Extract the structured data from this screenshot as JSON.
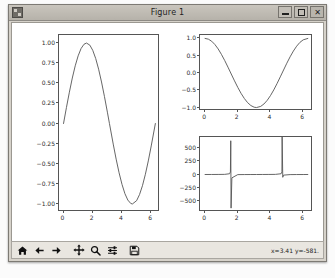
{
  "window": {
    "title": "Figure 1",
    "icon": "matplotlib-app-icon",
    "controls": {
      "minimize": "–",
      "maximize": "□",
      "close": "✕"
    }
  },
  "toolbar": {
    "buttons": [
      {
        "name": "home-icon",
        "tooltip": "Home"
      },
      {
        "name": "back-arrow-icon",
        "tooltip": "Back"
      },
      {
        "name": "forward-arrow-icon",
        "tooltip": "Forward"
      },
      {
        "name": "pan-move-icon",
        "tooltip": "Pan"
      },
      {
        "name": "zoom-magnifier-icon",
        "tooltip": "Zoom to rectangle"
      },
      {
        "name": "configure-subplots-icon",
        "tooltip": "Configure subplots"
      },
      {
        "name": "save-floppy-icon",
        "tooltip": "Save the figure"
      }
    ],
    "coordinates": "x=3.41  y=-581."
  },
  "caption": "",
  "chart_data": [
    {
      "type": "line",
      "name": "sine-subplot",
      "title": "",
      "xlabel": "",
      "ylabel": "",
      "x": [
        0,
        0.2,
        0.4,
        0.6,
        0.8,
        1.0,
        1.2,
        1.4,
        1.5708,
        1.8,
        2.0,
        2.2,
        2.4,
        2.6,
        2.8,
        3.0,
        3.1416,
        3.4,
        3.6,
        3.8,
        4.0,
        4.2,
        4.4,
        4.6,
        4.7124,
        5.0,
        5.2,
        5.4,
        5.6,
        5.8,
        6.0,
        6.2832
      ],
      "y": [
        0.0,
        0.199,
        0.389,
        0.565,
        0.717,
        0.841,
        0.932,
        0.985,
        1.0,
        0.974,
        0.909,
        0.808,
        0.675,
        0.516,
        0.335,
        0.141,
        0.0,
        -0.256,
        -0.443,
        -0.612,
        -0.757,
        -0.872,
        -0.952,
        -0.994,
        -1.0,
        -0.959,
        -0.883,
        -0.773,
        -0.631,
        -0.465,
        -0.279,
        0.0
      ],
      "xlim": [
        -0.31,
        6.6
      ],
      "ylim": [
        -1.1,
        1.1
      ],
      "xticks": [
        "0",
        "2",
        "4",
        "6"
      ],
      "xtick_values": [
        0,
        2,
        4,
        6
      ],
      "yticks": [
        "1.00",
        "0.75",
        "0.50",
        "0.25",
        "0.00",
        "−0.25",
        "−0.50",
        "−0.75",
        "−1.00"
      ],
      "ytick_values": [
        1.0,
        0.75,
        0.5,
        0.25,
        0.0,
        -0.25,
        -0.5,
        -0.75,
        -1.0
      ],
      "grid": false,
      "legend": null,
      "line_color": "#555555"
    },
    {
      "type": "line",
      "name": "cosine-subplot",
      "title": "",
      "xlabel": "",
      "ylabel": "",
      "x": [
        0,
        0.2,
        0.4,
        0.6,
        0.8,
        1.0,
        1.2,
        1.4,
        1.5708,
        1.8,
        2.0,
        2.2,
        2.4,
        2.6,
        2.8,
        3.0,
        3.1416,
        3.4,
        3.6,
        3.8,
        4.0,
        4.2,
        4.4,
        4.6,
        4.7124,
        5.0,
        5.2,
        5.4,
        5.6,
        5.8,
        6.0,
        6.2832
      ],
      "y": [
        1.0,
        0.98,
        0.921,
        0.825,
        0.697,
        0.54,
        0.362,
        0.17,
        0.0,
        -0.227,
        -0.416,
        -0.589,
        -0.737,
        -0.857,
        -0.942,
        -0.99,
        -1.0,
        -0.967,
        -0.897,
        -0.791,
        -0.654,
        -0.49,
        -0.307,
        -0.112,
        0.0,
        0.284,
        0.469,
        0.635,
        0.776,
        0.886,
        0.96,
        1.0
      ],
      "xlim": [
        -0.31,
        6.6
      ],
      "ylim": [
        -1.1,
        1.1
      ],
      "xticks": [
        "0",
        "2",
        "4",
        "6"
      ],
      "xtick_values": [
        0,
        2,
        4,
        6
      ],
      "yticks": [
        "1.0",
        "0.5",
        "0.0",
        "−0.5",
        "−1.0"
      ],
      "ytick_values": [
        1.0,
        0.5,
        0.0,
        -0.5,
        -1.0
      ],
      "grid": false,
      "legend": null,
      "line_color": "#555555"
    },
    {
      "type": "line",
      "name": "tangent-subplot",
      "title": "",
      "xlabel": "",
      "ylabel": "",
      "x": [
        0,
        0.4,
        0.8,
        1.2,
        1.5,
        1.55,
        1.5708,
        1.59,
        1.64,
        2.0,
        2.4,
        2.8,
        3.1416,
        3.5,
        3.9,
        4.3,
        4.65,
        4.7,
        4.7124,
        4.75,
        4.8,
        5.2,
        5.6,
        6.0,
        6.2832
      ],
      "y": [
        0,
        0.42,
        1.03,
        2.57,
        14.1,
        48.1,
        630,
        -628,
        -62.5,
        -2.19,
        -0.92,
        -0.36,
        0,
        0.37,
        0.95,
        2.29,
        14.2,
        48.5,
        700,
        -52.0,
        -11.4,
        -1.89,
        -0.81,
        -0.29,
        0
      ],
      "xlim": [
        -0.31,
        6.6
      ],
      "ylim": [
        -700,
        700
      ],
      "xticks": [
        "0",
        "2",
        "4",
        "6"
      ],
      "xtick_values": [
        0,
        2,
        4,
        6
      ],
      "yticks": [
        "500",
        "250",
        "0",
        "−250",
        "−500"
      ],
      "ytick_values": [
        500,
        250,
        0,
        -250,
        -500
      ],
      "grid": false,
      "legend": null,
      "line_color": "#555555"
    }
  ]
}
